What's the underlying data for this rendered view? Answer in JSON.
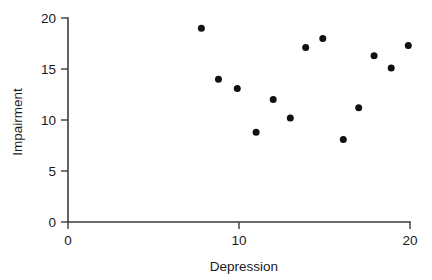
{
  "chart_data": {
    "type": "scatter",
    "title": "",
    "xlabel": "Depression",
    "ylabel": "Impairment",
    "xlim": [
      0,
      20
    ],
    "ylim": [
      0,
      20
    ],
    "xticks": [
      0,
      10,
      20
    ],
    "yticks": [
      0,
      5,
      10,
      15,
      20
    ],
    "xtick_labels": [
      "0",
      "10",
      "20"
    ],
    "ytick_labels": [
      "0",
      "5",
      "10",
      "15",
      "20"
    ],
    "grid": false,
    "legend": null,
    "marker": "filled-circle",
    "marker_color": "#111111",
    "n_points": 13,
    "points": [
      {
        "x": 7.8,
        "y": 19.0
      },
      {
        "x": 8.8,
        "y": 14.0
      },
      {
        "x": 9.9,
        "y": 13.1
      },
      {
        "x": 11.0,
        "y": 8.8
      },
      {
        "x": 12.0,
        "y": 12.0
      },
      {
        "x": 13.0,
        "y": 10.2
      },
      {
        "x": 13.9,
        "y": 17.1
      },
      {
        "x": 14.9,
        "y": 18.0
      },
      {
        "x": 16.1,
        "y": 8.1
      },
      {
        "x": 17.0,
        "y": 11.2
      },
      {
        "x": 17.9,
        "y": 16.3
      },
      {
        "x": 18.9,
        "y": 15.1
      },
      {
        "x": 19.9,
        "y": 17.3
      }
    ],
    "x": [
      7.8,
      8.8,
      9.9,
      11.0,
      12.0,
      13.0,
      13.9,
      14.9,
      16.1,
      17.0,
      17.9,
      18.9,
      19.9
    ],
    "values": [
      19.0,
      14.0,
      13.1,
      8.8,
      12.0,
      10.2,
      17.1,
      18.0,
      8.1,
      11.2,
      16.3,
      15.1,
      17.3
    ]
  },
  "axes": {
    "x_title": "Depression",
    "y_title": "Impairment",
    "x_tick_labels": [
      "0",
      "10",
      "20"
    ],
    "y_tick_labels": [
      "0",
      "5",
      "10",
      "15",
      "20"
    ]
  },
  "colors": {
    "marker": "#111111",
    "axis": "#3b3b3b",
    "text": "#1a1a1a",
    "background": "#ffffff"
  }
}
